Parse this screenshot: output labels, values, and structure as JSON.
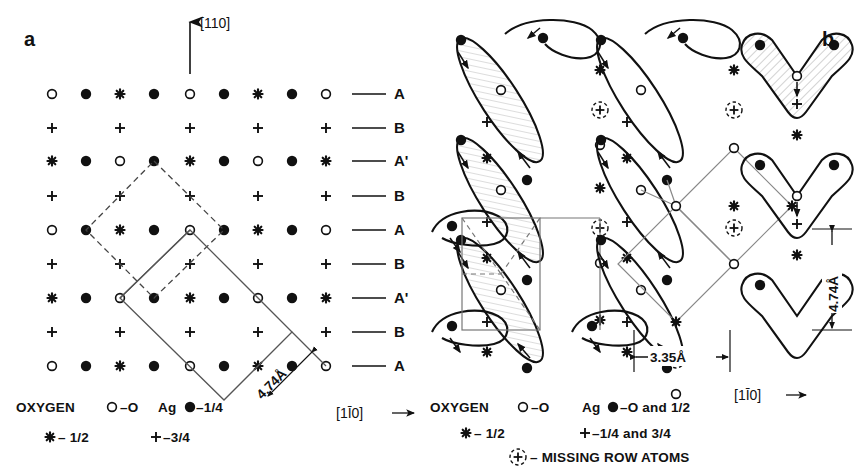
{
  "figure": {
    "panels": [
      {
        "id": "a",
        "letter": "a",
        "direction_up": "[110]",
        "direction_right": "[1Ī0]",
        "cell_dimension": "4.74Å",
        "row_labels": [
          "A",
          "B",
          "A'",
          "B",
          "A",
          "B",
          "A'",
          "B",
          "A"
        ],
        "row_patterns": [
          [
            "o",
            "f",
            "s",
            "f",
            "o",
            "f",
            "s",
            "f",
            "o"
          ],
          [
            "p",
            "",
            "p",
            "",
            "p",
            "",
            "p",
            "",
            "p"
          ],
          [
            "s",
            "f",
            "o",
            "f",
            "s",
            "f",
            "o",
            "f",
            "s"
          ],
          [
            "p",
            "",
            "p",
            "",
            "p",
            "",
            "p",
            "",
            "p"
          ],
          [
            "o",
            "f",
            "s",
            "f",
            "o",
            "f",
            "s",
            "f",
            "o"
          ],
          [
            "p",
            "",
            "p",
            "",
            "p",
            "",
            "p",
            "",
            "p"
          ],
          [
            "s",
            "f",
            "o",
            "f",
            "s",
            "f",
            "o",
            "f",
            "s"
          ],
          [
            "p",
            "",
            "p",
            "",
            "p",
            "",
            "p",
            "",
            "p"
          ],
          [
            "o",
            "f",
            "s",
            "f",
            "o",
            "f",
            "s",
            "f",
            "o"
          ]
        ],
        "legend": {
          "oxygen_label": "OXYGEN",
          "oxygen_open": "–O",
          "oxygen_star": "– 1/2",
          "ag_label": "Ag",
          "ag_filled": "–1/4",
          "ag_plus": "–3/4"
        }
      },
      {
        "id": "b",
        "letter": "b",
        "direction_right": "[1Ī0]",
        "dim_horizontal": "3.35Å",
        "dim_vertical": "4.74Å",
        "legend": {
          "oxygen_label": "OXYGEN",
          "oxygen_open": "–O",
          "oxygen_star": "– 1/2",
          "ag_label": "Ag",
          "ag_filled": "–O and 1/2",
          "ag_plus": "–1/4 and 3/4",
          "missing_row": "– MISSING ROW ATOMS"
        }
      }
    ],
    "symbols": {
      "open_circle": "open-circle-oxygen",
      "filled_circle": "filled-circle-silver",
      "star": "star-oxygen-half",
      "plus": "plus-silver",
      "dashed_circle": "dashed-circle-missing-row"
    },
    "colors": {
      "ink": "#111111",
      "thin_line": "#555555",
      "background": "#ffffff"
    }
  }
}
